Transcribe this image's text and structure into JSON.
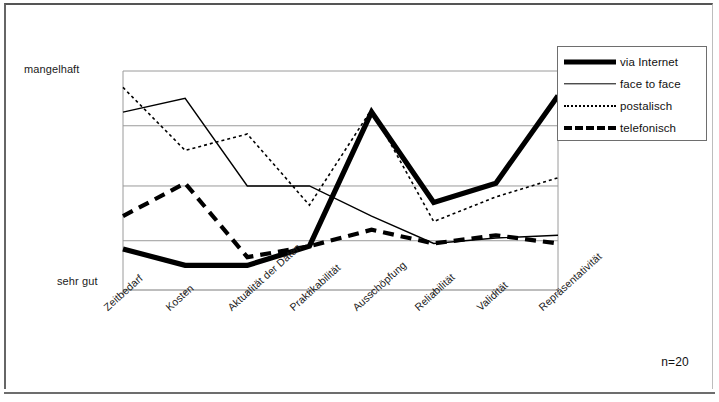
{
  "figure": {
    "annotation": "n=20"
  },
  "legend": {
    "items": [
      {
        "label": "via Internet",
        "style": "thick-solid",
        "key_icon": "line-thick-solid-icon"
      },
      {
        "label": "face to face",
        "style": "thin-solid",
        "key_icon": "line-thin-solid-icon"
      },
      {
        "label": "postalisch",
        "style": "dotted",
        "key_icon": "line-dotted-icon"
      },
      {
        "label": "telefonisch",
        "style": "thick-dashed",
        "key_icon": "line-dashed-icon"
      }
    ]
  },
  "axes": {
    "y_top_label": "mangelhaft",
    "y_bottom_label": "sehr gut",
    "x_labels": [
      "Zeitbedarf",
      "Kosten",
      "Aktualität der Daten",
      "Praktikabilität",
      "Ausschöpfung",
      "Reliabilität",
      "Validität",
      "Repräsentativität"
    ]
  },
  "chart_data": {
    "type": "line",
    "title": "",
    "subtitle": "",
    "xlabel": "",
    "ylabel": "",
    "annotation": "n=20",
    "grid": true,
    "gridlines_y": [
      1.9,
      2.9,
      4.0,
      5.0
    ],
    "legend_position": "top-right",
    "ylim": [
      1,
      5
    ],
    "y_tick_labels": {
      "1": "sehr gut",
      "5": "mangelhaft"
    },
    "categories": [
      "Zeitbedarf",
      "Kosten",
      "Aktualität der Daten",
      "Praktikabilität",
      "Ausschöpfung",
      "Reliabilität",
      "Validität",
      "Repräsentativität"
    ],
    "series": [
      {
        "name": "via Internet",
        "style": "thick-solid",
        "values": [
          1.75,
          1.45,
          1.45,
          1.8,
          4.25,
          2.6,
          2.95,
          4.55
        ]
      },
      {
        "name": "face to face",
        "style": "thin-solid",
        "values": [
          4.25,
          4.5,
          2.9,
          2.9,
          2.35,
          1.85,
          1.95,
          2.0
        ]
      },
      {
        "name": "postalisch",
        "style": "dotted",
        "values": [
          4.7,
          3.55,
          3.85,
          2.55,
          4.3,
          2.25,
          2.7,
          3.05
        ]
      },
      {
        "name": "telefonisch",
        "style": "thick-dashed",
        "values": [
          2.35,
          2.95,
          1.6,
          1.8,
          2.1,
          1.85,
          2.0,
          1.85
        ]
      }
    ]
  }
}
